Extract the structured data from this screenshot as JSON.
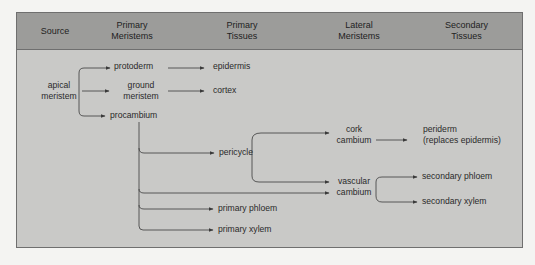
{
  "diagram": {
    "columns": [
      {
        "id": "source",
        "label": "Source"
      },
      {
        "id": "primary_meristems",
        "label": "Primary\nMeristems"
      },
      {
        "id": "primary_tissues",
        "label": "Primary\nTissues"
      },
      {
        "id": "lateral_meristems",
        "label": "Lateral\nMeristems"
      },
      {
        "id": "secondary_tissues",
        "label": "Secondary\nTissues"
      }
    ],
    "nodes": {
      "apical_meristem": "apical\nmeristem",
      "protoderm": "protoderm",
      "ground_meristem": "ground\nmeristem",
      "procambium": "procambium",
      "epidermis": "epidermis",
      "cortex": "cortex",
      "pericycle": "pericycle",
      "primary_phloem": "primary phloem",
      "primary_xylem": "primary xylem",
      "cork_cambium": "cork\ncambium",
      "vascular_cambium": "vascular\ncambium",
      "periderm": "periderm\n(replaces epidermis)",
      "secondary_phloem": "secondary phloem",
      "secondary_xylem": "secondary xylem"
    },
    "edges": [
      [
        "apical_meristem",
        "protoderm"
      ],
      [
        "apical_meristem",
        "ground_meristem"
      ],
      [
        "apical_meristem",
        "procambium"
      ],
      [
        "protoderm",
        "epidermis"
      ],
      [
        "ground_meristem",
        "cortex"
      ],
      [
        "procambium",
        "pericycle"
      ],
      [
        "procambium",
        "vascular_cambium"
      ],
      [
        "procambium",
        "primary_phloem"
      ],
      [
        "procambium",
        "primary_xylem"
      ],
      [
        "pericycle",
        "cork_cambium"
      ],
      [
        "pericycle",
        "vascular_cambium"
      ],
      [
        "cork_cambium",
        "periderm"
      ],
      [
        "vascular_cambium",
        "secondary_phloem"
      ],
      [
        "vascular_cambium",
        "secondary_xylem"
      ]
    ],
    "colors": {
      "header_bg": "#9c9c9a",
      "body_bg": "#c9c9c7",
      "border": "#6f6f6f",
      "line": "#3a3a3a",
      "text": "#2a2a2a"
    }
  }
}
